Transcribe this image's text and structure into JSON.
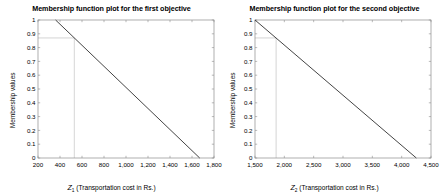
{
  "figure": {
    "background": "#ffffff",
    "line_color": "#3a3a3a",
    "axis_color": "#8c8c8c",
    "guide_color": "#b8b8b8"
  },
  "chart_data": [
    {
      "type": "line",
      "panel": "left",
      "title": "Membership function plot for the first objective",
      "xlabel_var": "Z",
      "xlabel_sub": "1",
      "xlabel_rest": " (Transportation cost in Rs.)",
      "ylabel": "Membership values",
      "xlim": [
        200,
        1800
      ],
      "ylim": [
        0,
        1
      ],
      "grid": false,
      "xticks": [
        200,
        400,
        600,
        800,
        1000,
        1200,
        1400,
        1600,
        1800
      ],
      "xticklabels": [
        "200",
        "400",
        "600",
        "800",
        "1,000",
        "1,200",
        "1,400",
        "1,600",
        "1,800"
      ],
      "yticks": [
        0,
        0.1,
        0.2,
        0.3,
        0.4,
        0.5,
        0.6,
        0.7,
        0.8,
        0.9,
        1
      ],
      "yticklabels": [
        "0",
        "0.1",
        "0.2",
        "0.3",
        "0.4",
        "0.5",
        "0.6",
        "0.7",
        "0.8",
        "0.9",
        "1"
      ],
      "series": [
        {
          "name": "membership",
          "x": [
            360,
            1670
          ],
          "y": [
            1,
            0
          ]
        }
      ],
      "annotations": {
        "guide_y": 0.87,
        "guide_x": 530,
        "description": "horizontal guide at membership 0.87 and vertical guide at cost 530"
      }
    },
    {
      "type": "line",
      "panel": "right",
      "title": "Membership function plot for the second objective",
      "xlabel_var": "Z",
      "xlabel_sub": "2",
      "xlabel_rest": " (Transportation cost in Rs.)",
      "ylabel": "Membership values",
      "xlim": [
        1500,
        4500
      ],
      "ylim": [
        0,
        1
      ],
      "grid": false,
      "xticks": [
        1500,
        2000,
        2500,
        3000,
        3500,
        4000,
        4500
      ],
      "xticklabels": [
        "1,500",
        "2,000",
        "2,500",
        "3,000",
        "3,500",
        "4,000",
        "4,500"
      ],
      "yticks": [
        0,
        0.1,
        0.2,
        0.3,
        0.4,
        0.5,
        0.6,
        0.7,
        0.8,
        0.9,
        1
      ],
      "yticklabels": [
        "0",
        "0.1",
        "0.2",
        "0.3",
        "0.4",
        "0.5",
        "0.6",
        "0.7",
        "0.8",
        "0.9",
        "1"
      ],
      "series": [
        {
          "name": "membership",
          "x": [
            1500,
            4250
          ],
          "y": [
            1,
            0
          ]
        }
      ],
      "annotations": {
        "guide_y": 0.87,
        "guide_x": 1860,
        "description": "horizontal guide at membership 0.87 and vertical guide at cost 1860"
      }
    }
  ]
}
